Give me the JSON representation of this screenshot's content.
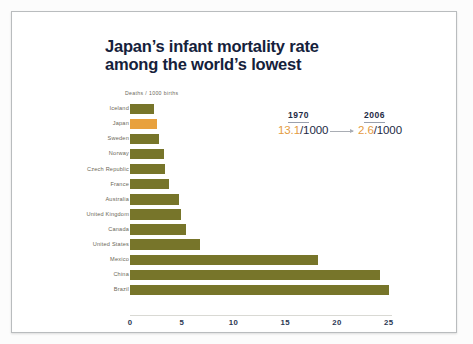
{
  "chart_data": {
    "type": "bar",
    "orientation": "horizontal",
    "title": "Japan’s infant mortality rate among the world’s lowest",
    "title_line1": "Japan’s infant mortality rate",
    "title_line2": "among the world’s lowest",
    "subtitle": "Deaths / 1000 births",
    "xlabel": "",
    "ylabel": "",
    "xlim": [
      0,
      26
    ],
    "grid": false,
    "legend": "none",
    "tick_labels": [
      "0",
      "5",
      "10",
      "15",
      "20",
      "25"
    ],
    "tick_values": [
      0,
      5,
      10,
      15,
      20,
      25
    ],
    "categories": [
      "Iceland",
      "Japan",
      "Sweden",
      "Norway",
      "Czech Republic",
      "France",
      "Australia",
      "United Kingdom",
      "Canada",
      "United States",
      "Mexico",
      "China",
      "Brazil"
    ],
    "values": [
      2.3,
      2.6,
      2.8,
      3.3,
      3.4,
      3.8,
      4.7,
      4.9,
      5.4,
      6.8,
      18.2,
      24.2,
      25.0
    ],
    "highlight_category": "Japan",
    "bar_color": "#77752A",
    "highlight_color": "#E8A13E",
    "annotations": {
      "year_1970_label": "1970",
      "year_1970_value_number": "13.1",
      "year_1970_value_unit": "/1000",
      "year_2006_label": "2006",
      "year_2006_value_number": "2.6",
      "year_2006_value_unit": "/1000",
      "arrow": "right-arrow"
    }
  }
}
